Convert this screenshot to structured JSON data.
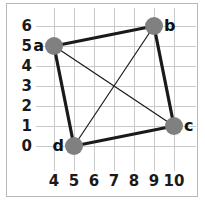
{
  "chart_data": {
    "type": "scatter",
    "title": "",
    "subtitle": "",
    "xlabel": "",
    "ylabel": "",
    "grid": true,
    "legend": "none",
    "xlim": [
      3.5,
      10.8
    ],
    "ylim": [
      -0.7,
      6.6
    ],
    "xticks": [
      4,
      5,
      6,
      7,
      8,
      9,
      10
    ],
    "yticks": [
      0,
      1,
      2,
      3,
      4,
      5,
      6
    ],
    "xtick_labels": [
      "4",
      "5",
      "6",
      "7",
      "8",
      "9",
      "10"
    ],
    "ytick_labels": [
      "0",
      "1",
      "2",
      "3",
      "4",
      "5",
      "6"
    ],
    "nodes": [
      {
        "id": "a",
        "label": "a",
        "x": 4,
        "y": 5,
        "label_side": "left"
      },
      {
        "id": "b",
        "label": "b",
        "x": 9,
        "y": 6,
        "label_side": "right"
      },
      {
        "id": "c",
        "label": "c",
        "x": 10,
        "y": 1,
        "label_side": "right"
      },
      {
        "id": "d",
        "label": "d",
        "x": 5,
        "y": 0,
        "label_side": "left"
      }
    ],
    "edges": [
      {
        "from": "a",
        "to": "b",
        "weight": "thick"
      },
      {
        "from": "b",
        "to": "c",
        "weight": "thick"
      },
      {
        "from": "c",
        "to": "d",
        "weight": "thick"
      },
      {
        "from": "d",
        "to": "a",
        "weight": "thick"
      },
      {
        "from": "a",
        "to": "c",
        "weight": "thin"
      },
      {
        "from": "b",
        "to": "d",
        "weight": "thin"
      }
    ],
    "colors": {
      "node_fill": "#808080",
      "edge": "#1a1a1a",
      "grid": "#c9c9c9",
      "frame": "#b9b9b9",
      "background": "#ffffff",
      "text": "#1a1a1a"
    },
    "style": {
      "node_radius_px": 9,
      "thick_edge_width_px": 3.2,
      "thin_edge_width_px": 1.2
    }
  }
}
